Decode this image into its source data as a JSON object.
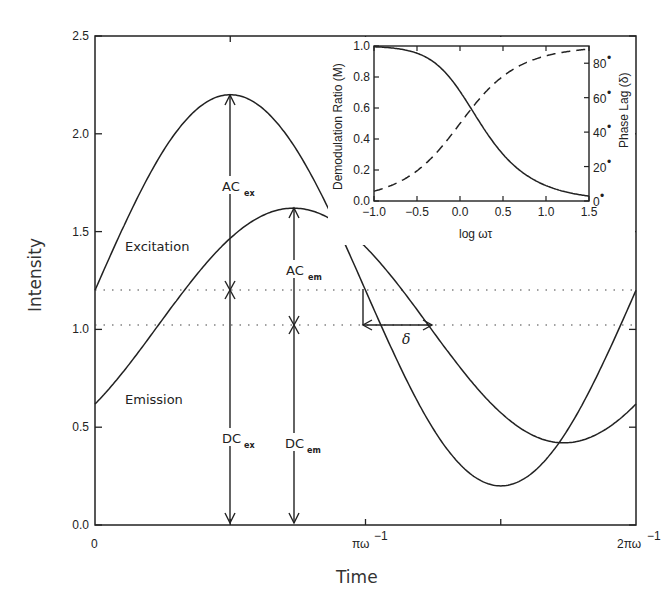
{
  "chart_data": [
    {
      "type": "line",
      "title": "",
      "xlabel": "Time",
      "ylabel": "Intensity",
      "xlim": [
        "0",
        "2πω⁻¹"
      ],
      "ylim": [
        0.0,
        2.5
      ],
      "x_tick_labels": [
        "0",
        "πω⁻¹",
        "2πω⁻¹"
      ],
      "y_tick_labels": [
        "0.0",
        "0.5",
        "1.0",
        "1.5",
        "2.0",
        "2.5"
      ],
      "grid": false,
      "series": [
        {
          "name": "Excitation",
          "style": "solid",
          "dc": 1.2,
          "ac": 1.0,
          "phase_deg": 0,
          "max": 2.2,
          "min": 0.2,
          "start_value": 1.2
        },
        {
          "name": "Emission",
          "style": "solid",
          "dc": 1.02,
          "ac": 0.6,
          "phase_deg": 42,
          "max": 1.62,
          "min": 0.42,
          "start_value": 0.6
        }
      ],
      "reference_lines": [
        {
          "name": "DC excitation level",
          "y": 1.2,
          "style": "dotted"
        },
        {
          "name": "DC emission level",
          "y": 1.02,
          "style": "dotted"
        }
      ],
      "annotations": [
        {
          "text": "Excitation",
          "x_frac": 0.05,
          "y": 1.45
        },
        {
          "text": "Emission",
          "x_frac": 0.05,
          "y": 0.65
        },
        {
          "text": "AC",
          "sub": "ex",
          "description": "arrow from 1.2 to 2.2"
        },
        {
          "text": "DC",
          "sub": "ex",
          "description": "arrow from 0 to 1.2"
        },
        {
          "text": "AC",
          "sub": "em",
          "description": "arrow from 1.02 to 1.62"
        },
        {
          "text": "DC",
          "sub": "em",
          "description": "arrow from 0 to 1.02"
        },
        {
          "text": "δ",
          "description": "phase shift arrow between curves at DC levels"
        }
      ]
    },
    {
      "type": "line",
      "title": "",
      "xlabel": "log ωτ",
      "ylabel": "Demodulation Ratio (M)",
      "y2label": "Phase Lag (δ)",
      "xlim": [
        -1.0,
        1.5
      ],
      "ylim": [
        0.0,
        1.0
      ],
      "y2lim": [
        0,
        90
      ],
      "x_tick_labels": [
        "−1.0",
        "−0.5",
        "0.0",
        "0.5",
        "1.0",
        "1.5"
      ],
      "y_tick_labels": [
        "0.0",
        "0.2",
        "0.4",
        "0.6",
        "0.8",
        "1.0"
      ],
      "y2_tick_labels": [
        "0°",
        "20°",
        "40°",
        "60°",
        "80°"
      ],
      "series": [
        {
          "name": "Demodulation Ratio (M)",
          "style": "solid",
          "axis": "left",
          "x": [
            -1.0,
            -0.75,
            -0.5,
            -0.25,
            0.0,
            0.25,
            0.5,
            0.75,
            1.0,
            1.25,
            1.5
          ],
          "values": [
            0.995,
            0.985,
            0.95,
            0.87,
            0.71,
            0.49,
            0.3,
            0.18,
            0.1,
            0.06,
            0.03
          ]
        },
        {
          "name": "Phase Lag (δ)",
          "style": "dashed",
          "axis": "right",
          "x": [
            -1.0,
            -0.75,
            -0.5,
            -0.25,
            0.0,
            0.25,
            0.5,
            0.75,
            1.0,
            1.25,
            1.5
          ],
          "values": [
            5.7,
            10.1,
            17.5,
            29.4,
            45.0,
            60.6,
            72.5,
            79.9,
            84.3,
            86.8,
            88.2
          ]
        }
      ]
    }
  ],
  "labels": {
    "main_ylabel": "Intensity",
    "main_xlabel": "Time",
    "x_tick_0": "0",
    "x_tick_pi": "πω",
    "x_tick_2pi": "2πω",
    "x_tick_exp": "−1",
    "y_ticks": [
      "0.0",
      "0.5",
      "1.0",
      "1.5",
      "2.0",
      "2.5"
    ],
    "excitation": "Excitation",
    "emission": "Emission",
    "ac": "AC",
    "dc": "DC",
    "ex": "ex",
    "em": "em",
    "delta": "δ",
    "inset_xlabel": "log ωτ",
    "inset_ylabel": "Demodulation Ratio (M)",
    "inset_y2label": "Phase Lag (δ)",
    "inset_x_ticks": [
      "−1.0",
      "−0.5",
      "0.0",
      "0.5",
      "1.0",
      "1.5"
    ],
    "inset_y_ticks": [
      "0.0",
      "0.2",
      "0.4",
      "0.6",
      "0.8",
      "1.0"
    ],
    "inset_y2_ticks": [
      "0",
      "20",
      "40",
      "60",
      "80"
    ],
    "degree": "•"
  }
}
